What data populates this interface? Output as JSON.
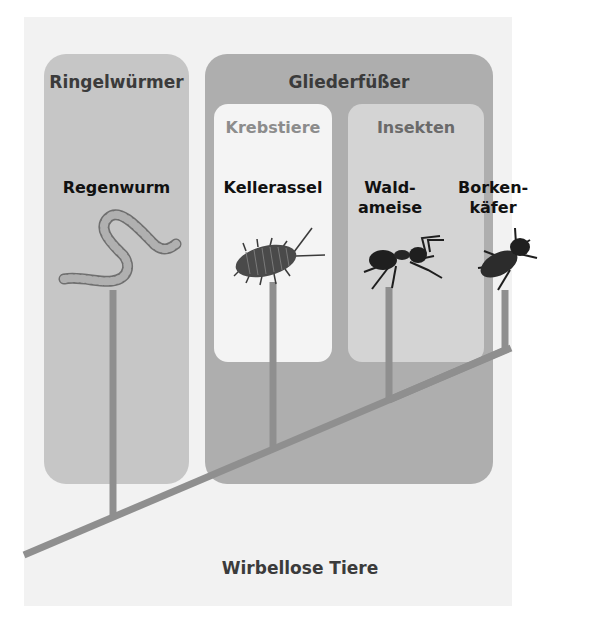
{
  "diagram": {
    "root_label": "Wirbellose Tiere",
    "groups": [
      {
        "id": "ringelwuermer",
        "title": "Ringelwürmer",
        "species": [
          {
            "name": "Regenwurm",
            "animal": "earthworm"
          }
        ]
      },
      {
        "id": "gliederfuesser",
        "title": "Gliederfüßer",
        "subgroups": [
          {
            "id": "krebstiere",
            "title": "Krebstiere",
            "species": [
              {
                "name": "Kellerassel",
                "animal": "woodlouse"
              }
            ]
          },
          {
            "id": "insekten",
            "title": "Insekten",
            "species": [
              {
                "name": "Wald-\nameise",
                "line1": "Wald-",
                "line2": "ameise",
                "animal": "ant"
              },
              {
                "name": "Borken-\nkäfer",
                "line1": "Borken-",
                "line2": "käfer",
                "animal": "bark-beetle"
              }
            ]
          }
        ]
      }
    ],
    "colors": {
      "background": "#f2f2f2",
      "ringelwuermer_box": "#c6c6c6",
      "gliederfuesser_box": "#aeaeae",
      "krebstiere_box": "#f4f4f4",
      "insekten_box": "#d4d4d4",
      "branch": "#8f8f8f",
      "title_dark": "#3b3b3b",
      "title_light": "#8c8c8c",
      "insekten_title": "#6a6a6a"
    }
  }
}
